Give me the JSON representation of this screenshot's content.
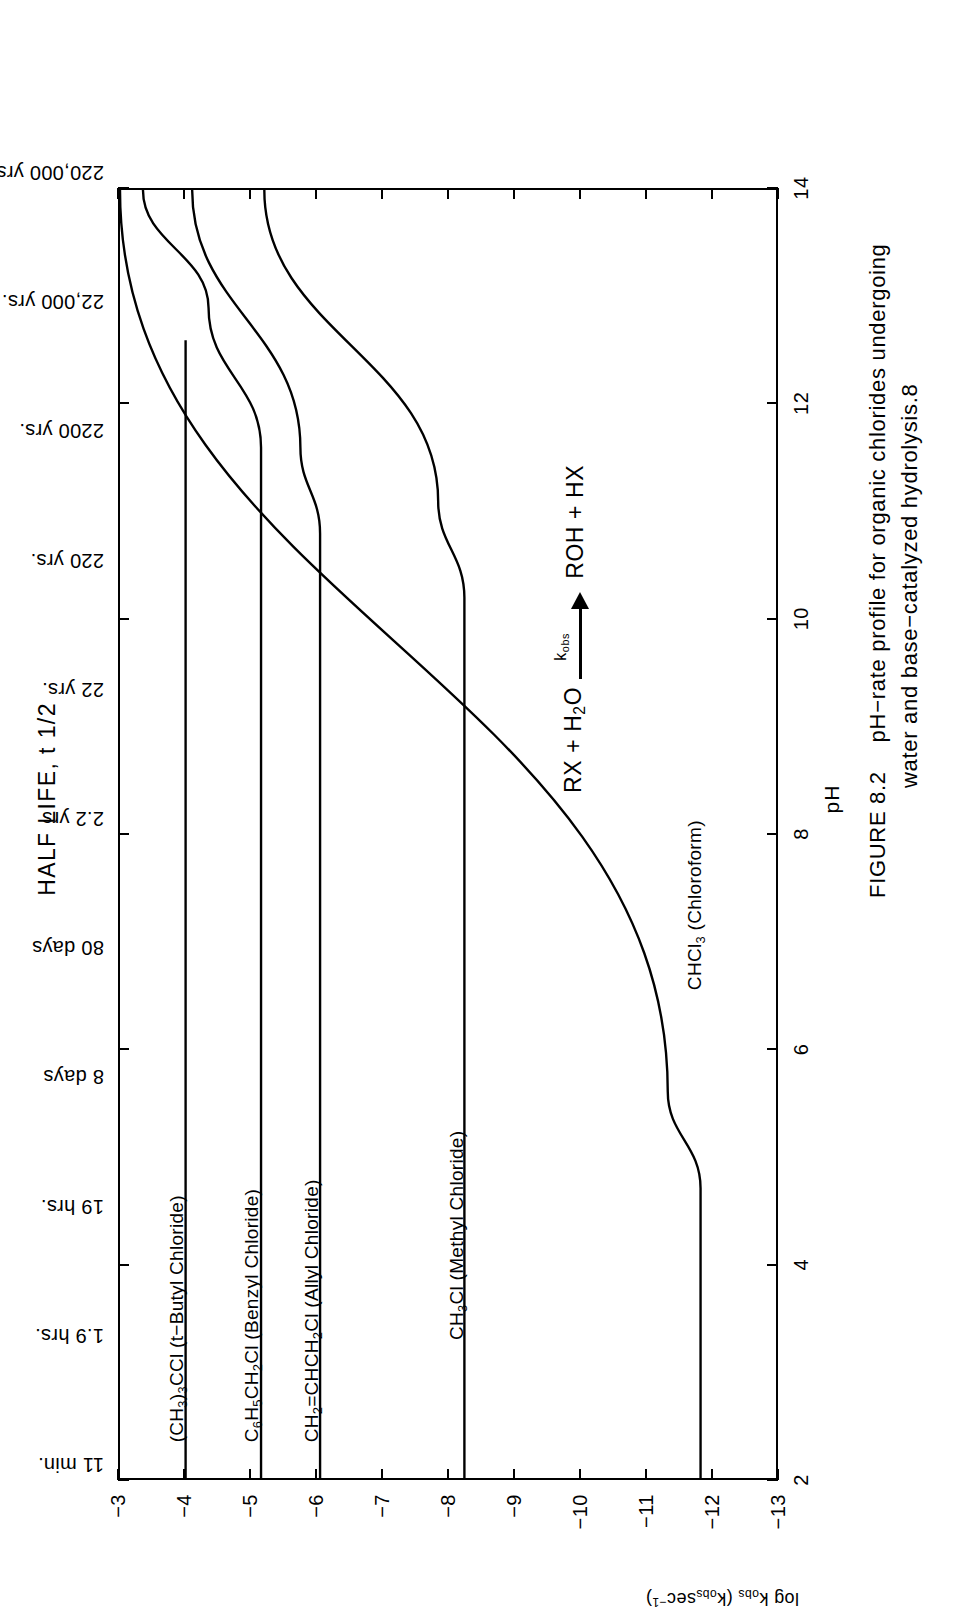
{
  "figure": {
    "top_title": "HALF LIFE, t 1/2",
    "xlabel": "pH",
    "ylabel_main": "log k",
    "ylabel_sub": "obs",
    "ylabel_paren": "(k",
    "ylabel_paren_sub": "obs",
    "ylabel_paren_rest": "sec",
    "ylabel_paren_sup": "-1",
    "ylabel_paren_close": ")",
    "caption_id": "FIGURE 8.2",
    "caption_line1": "pH−rate profile for organic chlorides undergoing",
    "caption_line2": "water and base−catalyzed hydrolysis.8"
  },
  "reaction": {
    "left": "RX + H",
    "left_sub": "2",
    "left_rest": "O",
    "arrow_label": "k",
    "arrow_label_sub": "obs",
    "right": "ROH + HX"
  },
  "chart_data": {
    "type": "line",
    "title": "HALF LIFE, t 1/2",
    "xlabel": "pH",
    "ylabel": "log k obs (kobs sec-1)",
    "xlim": [
      2,
      14
    ],
    "ylim": [
      -13,
      -3
    ],
    "grid": false,
    "legend": "inline-curve-labels",
    "xticks": [
      2,
      4,
      6,
      8,
      10,
      12,
      14
    ],
    "xtick_labels": [
      "2",
      "4",
      "6",
      "8",
      "10",
      "12",
      "14"
    ],
    "yticks": [
      -3,
      -4,
      -5,
      -6,
      -7,
      -8,
      -9,
      -10,
      -11,
      -12,
      -13
    ],
    "ytick_labels": [
      "-3",
      "-4",
      "-5",
      "-6",
      "-7",
      "-8",
      "-9",
      "-10",
      "-11",
      "-12",
      "-13"
    ],
    "secondary_axis": {
      "name": "HALF LIFE, t 1/2",
      "position": "top",
      "at_y": [
        -3,
        -4,
        -5,
        -6,
        -7,
        -8,
        -9,
        -10,
        -11,
        -12,
        -13
      ],
      "labels": [
        "11 min.",
        "1.9 hrs.",
        "19 hrs.",
        "8 days",
        "80 days",
        "2.2 yrs",
        "22 yrs.",
        "220 yrs.",
        "2200 yrs.",
        "22,000 yrs.",
        "220,000 yrs."
      ]
    },
    "series": [
      {
        "name": "(CH3)3CCl (t-Butyl Chloride)",
        "label_html": "(CH<sub>3</sub>)<sub>3</sub>CCl (t−Butyl Chloride)",
        "points": [
          [
            2,
            -4.0
          ],
          [
            12.6,
            -4.0
          ]
        ]
      },
      {
        "name": "C6H5CH2Cl (Benzyl Chloride)",
        "label_html": "C<sub>6</sub>H<sub>5</sub>CH<sub>2</sub>Cl (Benzyl Chloride)",
        "points": [
          [
            2,
            -5.15
          ],
          [
            11.6,
            -5.15
          ],
          [
            12.9,
            -4.35
          ],
          [
            14,
            -3.35
          ]
        ]
      },
      {
        "name": "CH2=CHCH2Cl (Allyl Chloride)",
        "label_html": "CH<sub>2</sub>=CHCH<sub>2</sub>Cl (Allyl Chloride)",
        "points": [
          [
            2,
            -6.05
          ],
          [
            10.8,
            -6.05
          ],
          [
            11.6,
            -5.75
          ],
          [
            14,
            -4.1
          ]
        ]
      },
      {
        "name": "CH3Cl (Methyl Chloride)",
        "label_html": "CH<sub>3</sub>Cl (Methyl Chloride)",
        "points": [
          [
            2,
            -8.25
          ],
          [
            10.2,
            -8.25
          ],
          [
            11.1,
            -7.85
          ],
          [
            14,
            -5.2
          ]
        ]
      },
      {
        "name": "CHCl3 (Chloroform)",
        "label_html": "CHCl<sub>3</sub> (Chloroform)",
        "points": [
          [
            2,
            -11.85
          ],
          [
            4.7,
            -11.85
          ],
          [
            5.6,
            -11.35
          ],
          [
            14,
            -3.0
          ]
        ]
      }
    ],
    "annotations": [
      {
        "text": "RX + H2O  --kobs-->  ROH + HX",
        "x": 10.5,
        "y": -9.6
      }
    ]
  },
  "curve_labels": [
    {
      "html": "(CH<sub>3</sub>)<sub>3</sub>CCl (t−Butyl Chloride)",
      "name": "t-butyl-chloride"
    },
    {
      "html": "C<sub>6</sub>H<sub>5</sub>CH<sub>2</sub>Cl (Benzyl Chloride)",
      "name": "benzyl-chloride"
    },
    {
      "html": "CH<sub>2</sub>=CHCH<sub>2</sub>Cl (Allyl Chloride)",
      "name": "allyl-chloride"
    },
    {
      "html": "CH<sub>3</sub>Cl (Methyl Chloride)",
      "name": "methyl-chloride"
    },
    {
      "html": "CHCl<sub>3</sub> (Chloroform)",
      "name": "chloroform"
    }
  ]
}
